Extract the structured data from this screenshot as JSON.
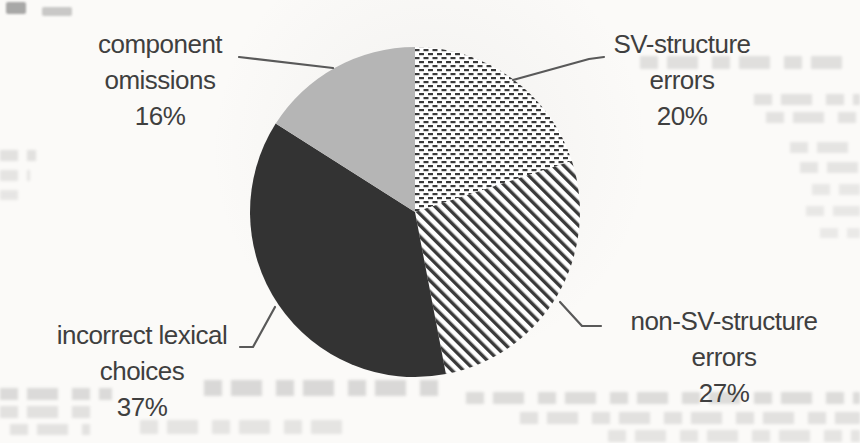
{
  "page": {
    "kind": "scanned-document-figure",
    "background_color": "#fbfaf8"
  },
  "chart_data": {
    "type": "pie",
    "title": "",
    "legend": "none",
    "labels_position": "outside-with-leader-lines",
    "direction": "clockwise",
    "start_angle_deg": 0,
    "slices": [
      {
        "id": "sv-structure-errors",
        "name": "SV-structure errors",
        "value": 20,
        "pct_label": "20%",
        "label": "SV-structure\nerrors\n20%",
        "fill": "dots",
        "pattern": "dense-horizontal-dashes"
      },
      {
        "id": "non-sv-structure-errors",
        "name": "non-SV-structure errors",
        "value": 27,
        "pct_label": "27%",
        "label": "non-SV-structure\nerrors\n27%",
        "fill": "stripes",
        "pattern": "diagonal-stripes-45deg"
      },
      {
        "id": "incorrect-lexical-choices",
        "name": "incorrect lexical choices",
        "value": 37,
        "pct_label": "37%",
        "label": "incorrect lexical\nchoices\n37%",
        "fill": "black",
        "pattern": "solid-black"
      },
      {
        "id": "component-omissions",
        "name": "component omissions",
        "value": 16,
        "pct_label": "16%",
        "label": "component\nomissions\n16%",
        "fill": "gray",
        "pattern": "solid-light-gray"
      }
    ],
    "colors": {
      "black": "#333333",
      "gray": "#b5b5b5",
      "pattern_ink": "#3a3a3a",
      "pattern_bg": "#ffffff",
      "label_text": "#3f3f3f",
      "leader_line": "#595959",
      "background": "#fbfaf8"
    }
  }
}
